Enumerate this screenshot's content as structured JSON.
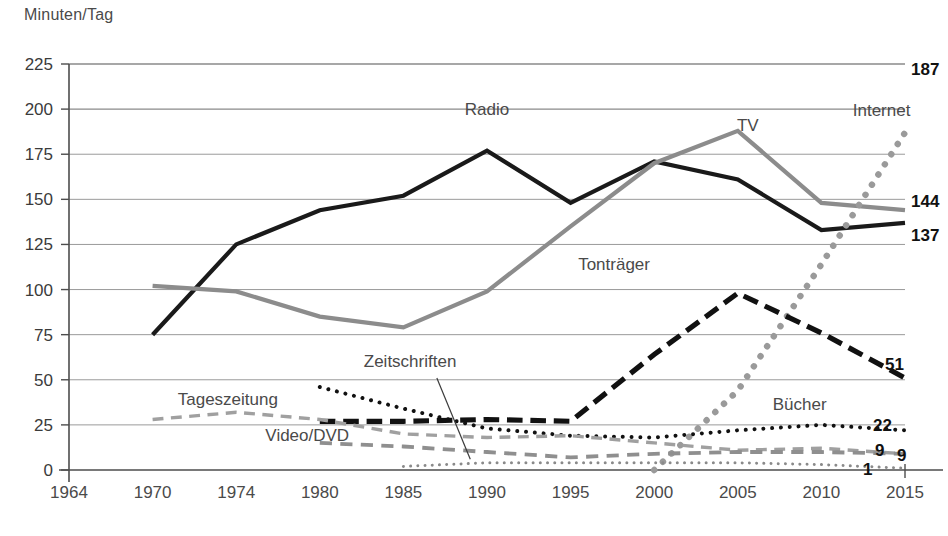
{
  "axis_title": "Minuten/Tag",
  "chart_data": {
    "type": "line",
    "title": "",
    "subtitle": "",
    "xlabel": "",
    "ylabel": "Minuten/Tag",
    "ylim": [
      0,
      225
    ],
    "ytick_step": 25,
    "yticks": [
      "0",
      "25",
      "50",
      "75",
      "100",
      "125",
      "150",
      "175",
      "200",
      "225"
    ],
    "grid": true,
    "legend_position": "inline-labels",
    "categories": [
      "1964",
      "1970",
      "1974",
      "1980",
      "1985",
      "1990",
      "1995",
      "2000",
      "2005",
      "2010",
      "2015"
    ],
    "series": [
      {
        "name": "Radio",
        "style": "solid",
        "color": "#1a1a1a",
        "width": 4.2,
        "label": "Radio",
        "label_x": 1990,
        "label_y": 197,
        "end_label": "137",
        "values": [
          null,
          75,
          125,
          144,
          152,
          177,
          148,
          171,
          161,
          133,
          137
        ]
      },
      {
        "name": "TV",
        "style": "solid",
        "color": "#8c8c8c",
        "width": 4.2,
        "label": "TV",
        "label_x": 2005.6,
        "label_y": 188,
        "end_label": "144",
        "values": [
          null,
          102,
          99,
          85,
          79,
          99,
          135,
          170,
          188,
          148,
          144
        ]
      },
      {
        "name": "Internet",
        "style": "dotted",
        "color": "#9a9a9a",
        "width": 6.5,
        "label": "Internet",
        "label_x": 2013.6,
        "label_y": 196,
        "end_label": "187",
        "values": [
          null,
          null,
          null,
          null,
          null,
          null,
          null,
          0,
          44,
          114,
          187
        ]
      },
      {
        "name": "Tonträger",
        "style": "dashed-bold",
        "color": "#111111",
        "width": 5.2,
        "label": "Tonträger",
        "label_x": 1997.6,
        "label_y": 111,
        "end_label": "51",
        "values": [
          null,
          null,
          null,
          27,
          27,
          28,
          27,
          64,
          98,
          76,
          51
        ]
      },
      {
        "name": "Bücher",
        "style": "dotted-fine",
        "color": "#111111",
        "width": 4.0,
        "label": "Bücher",
        "label_x": 2008.7,
        "label_y": 33,
        "end_label": "22",
        "values": [
          null,
          null,
          null,
          46,
          34,
          23,
          19,
          18,
          22,
          25,
          22
        ]
      },
      {
        "name": "Tageszeitung",
        "style": "dashed-fine",
        "color": "#a0a0a0",
        "width": 3.4,
        "label": "Tageszeitung",
        "label_x": 1973.6,
        "label_y": 36,
        "end_label": "9",
        "values": [
          null,
          28,
          32,
          28,
          20,
          18,
          19,
          15,
          11,
          12,
          9
        ]
      },
      {
        "name": "Zeitschriften",
        "style": "dashed-fine",
        "color": "#8f8f8f",
        "width": 3.8,
        "label": "Zeitschriften",
        "label_x": 1985.4,
        "label_y": 57,
        "end_label": "9",
        "values": [
          null,
          null,
          null,
          15,
          13,
          10,
          7,
          9,
          10,
          10,
          9
        ]
      },
      {
        "name": "Video/DVD",
        "style": "dotted-tiny",
        "color": "#8a8a8a",
        "width": 3.0,
        "label": "Video/DVD",
        "label_x": 1979.1,
        "label_y": 16,
        "end_label": "1",
        "values": [
          null,
          null,
          null,
          null,
          2,
          4,
          4,
          4,
          4,
          3,
          1
        ]
      }
    ],
    "annotations": [
      {
        "name": "zeitschriften-leader",
        "from_x": 1987.0,
        "from_y": 51,
        "to_x": 1989.0,
        "to_y": 6
      }
    ]
  }
}
